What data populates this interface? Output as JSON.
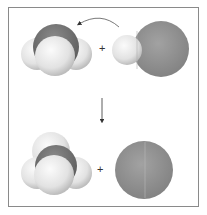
{
  "diagram": {
    "title": "",
    "reactants": [
      {
        "name": "ammonia",
        "formula": "NH3",
        "role": "proton-acceptor"
      },
      {
        "name": "hydrogen-chloride",
        "formula": "HCl",
        "role": "proton-donor"
      }
    ],
    "products": [
      {
        "name": "ammonium",
        "formula": "NH4+"
      },
      {
        "name": "chloride",
        "formula": "Cl-"
      }
    ],
    "operators": {
      "top_plus": "+",
      "bottom_plus": "+"
    },
    "arrows": {
      "transfer": "proton transfer from HCl to NH3",
      "reaction": "reaction proceeds downward"
    },
    "colors": {
      "hydrogen": "#e6e6e6",
      "nitrogen": "#6f6f6f",
      "chlorine": "#8d8d8d",
      "frame": "#8a8a8a"
    }
  }
}
